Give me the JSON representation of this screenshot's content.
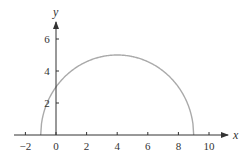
{
  "chart_data": {
    "type": "line",
    "title": "",
    "xlabel": "x",
    "ylabel": "y",
    "xlim": [
      -2.5,
      10.6
    ],
    "ylim": [
      0,
      7
    ],
    "x_ticks": [
      -2,
      0,
      2,
      4,
      6,
      8,
      10
    ],
    "x_tick_labels": [
      "−2",
      "0",
      "2",
      "4",
      "6",
      "8",
      "10"
    ],
    "y_ticks": [
      2,
      4,
      6
    ],
    "y_tick_labels": [
      "2",
      "4",
      "6"
    ],
    "grid": false,
    "legend": null,
    "series": [
      {
        "name": "semicircle y = sqrt(25 - (x - 4)^2)",
        "color": "#aaaaaa",
        "center": [
          4,
          0
        ],
        "radius": 5,
        "x": [
          -1,
          -0.5,
          0,
          1,
          2,
          3,
          4,
          5,
          6,
          7,
          8,
          8.5,
          9
        ],
        "y": [
          0,
          2.18,
          3,
          4,
          4.58,
          4.9,
          5,
          4.9,
          4.58,
          4,
          3,
          2.18,
          0
        ]
      }
    ],
    "key_points": {
      "left_x_intercept": [
        -1,
        0
      ],
      "right_x_intercept": [
        9,
        0
      ],
      "y_intercept": [
        0,
        3
      ],
      "maximum": [
        4,
        5
      ]
    }
  },
  "colors": {
    "axis": "#333333",
    "curve": "#aaaaaa"
  }
}
